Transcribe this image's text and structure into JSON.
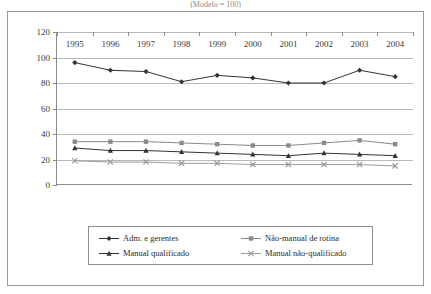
{
  "figure": {
    "title_partial": "(Modelo = 100)",
    "frame_color": "#9a9a9a"
  },
  "chart_data": {
    "type": "line",
    "title": "",
    "xlabel": "",
    "ylabel": "",
    "x": [
      1995,
      1996,
      1997,
      1998,
      1999,
      2000,
      2001,
      2002,
      2003,
      2004
    ],
    "categories": [
      "1995",
      "1996",
      "1997",
      "1998",
      "1999",
      "2000",
      "2001",
      "2002",
      "2003",
      "2004"
    ],
    "ylim": [
      0,
      120
    ],
    "yticks": [
      0,
      20,
      40,
      60,
      80,
      100,
      120
    ],
    "ytick_labels": [
      "0",
      "20",
      "40",
      "60",
      "80",
      "100",
      "120"
    ],
    "grid": true,
    "grid_axis": "y",
    "legend_position": "bottom",
    "series": [
      {
        "name": "Adm. e gerentes",
        "marker": "diamond",
        "color": "#333333",
        "values": [
          96,
          90,
          89,
          81,
          86,
          84,
          80,
          80,
          90,
          85
        ]
      },
      {
        "name": "Não-manual de rotina",
        "marker": "square",
        "color": "#8a8a8a",
        "values": [
          34,
          34,
          34,
          33,
          32,
          31,
          31,
          33,
          35,
          32
        ]
      },
      {
        "name": "Manual qualificado",
        "marker": "triangle",
        "color": "#333333",
        "values": [
          29,
          27,
          27,
          26,
          25,
          24,
          23,
          25,
          24,
          23
        ]
      },
      {
        "name": "Manual não-qualificado",
        "marker": "cross",
        "color": "#9a9a9a",
        "values": [
          19,
          18,
          18,
          17,
          17,
          16,
          16,
          16,
          16,
          15
        ]
      }
    ]
  },
  "legend": {
    "items": [
      {
        "label": "Adm. e gerentes",
        "marker": "diamond",
        "color": "#333333"
      },
      {
        "label": "Não-manual de rotina",
        "marker": "square",
        "color": "#8a8a8a"
      },
      {
        "label": "Manual qualificado",
        "marker": "triangle",
        "color": "#333333"
      },
      {
        "label": "Manual não-qualificado",
        "marker": "cross",
        "color": "#9a9a9a"
      }
    ]
  }
}
